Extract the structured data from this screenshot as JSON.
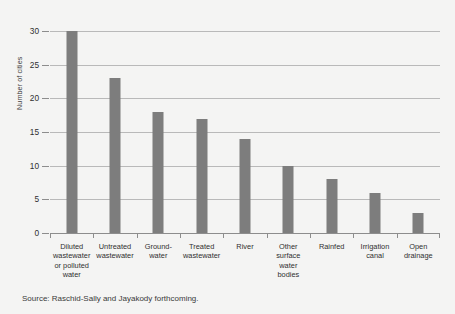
{
  "chart_data": {
    "type": "bar",
    "title": "",
    "xlabel": "",
    "ylabel": "Number of cities",
    "ylim": [
      0,
      30
    ],
    "yticks": [
      0,
      5,
      10,
      15,
      20,
      25,
      30
    ],
    "grid": true,
    "legend": "none",
    "orientation": "vertical",
    "bar_color": "#7d7d7d",
    "categories": [
      "Diluted wastewater or polluted water",
      "Untreated wastewater",
      "Ground- water",
      "Treated wastewater",
      "River",
      "Other surface water bodies",
      "Rainfed",
      "Irrigation canal",
      "Open drainage"
    ],
    "category_lines": [
      [
        "Diluted",
        "wastewater",
        "or polluted",
        "water"
      ],
      [
        "Untreated",
        "wastewater"
      ],
      [
        "Ground-",
        "water"
      ],
      [
        "Treated",
        "wastewater"
      ],
      [
        "River"
      ],
      [
        "Other",
        "surface",
        "water",
        "bodies"
      ],
      [
        "Rainfed"
      ],
      [
        "Irrigation",
        "canal"
      ],
      [
        "Open",
        "drainage"
      ]
    ],
    "values": [
      30,
      23,
      18,
      17,
      14,
      10,
      8,
      6,
      3
    ]
  },
  "source_note": "Source: Raschid-Sally and Jayakody forthcoming.",
  "colors": {
    "bar": "#7d7d7d",
    "gridline": "#b9b9b9",
    "axis": "#8d8d8d",
    "background": "#f4f4f3",
    "text": "#2f2f2f"
  }
}
